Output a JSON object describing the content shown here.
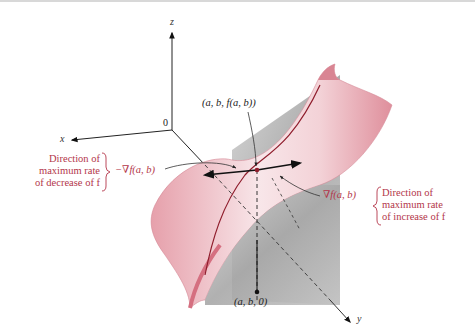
{
  "figure": {
    "axes": {
      "x": "x",
      "y": "y",
      "z": "z",
      "origin": "0"
    },
    "point_on_surface": "(a, b, f(a, b))",
    "point_in_plane": "(a, b, 0)",
    "neg_gradient": "−∇f(a, b)",
    "pos_gradient": "∇f(a, b)",
    "decrease_note": [
      "Direction of",
      "maximum rate",
      "of decrease of f"
    ],
    "increase_note": [
      "Direction of",
      "maximum rate",
      "of increase of f"
    ]
  },
  "colors": {
    "surface": "#e9a9b3",
    "surface_light": "#f7e3e6",
    "curve": "#8f1d2c",
    "label_red": "#b3364a",
    "plane": "#9a9a9a"
  }
}
